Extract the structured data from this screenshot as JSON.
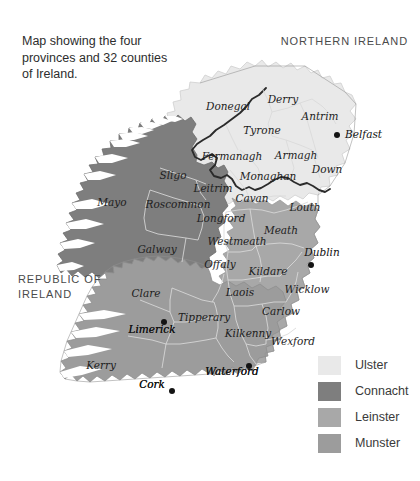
{
  "caption": "Map showing the four provinces and 32 counties of Ireland.",
  "titles": {
    "northern_ireland": "NORTHERN IRELAND",
    "republic_of_ireland_line1": "REPUBLIC OF",
    "republic_of_ireland_line2": "IRELAND"
  },
  "legend": {
    "items": [
      {
        "label": "Ulster",
        "color": "#e9e9e9"
      },
      {
        "label": "Connacht",
        "color": "#7e7e7e"
      },
      {
        "label": "Leinster",
        "color": "#a8a8a8"
      },
      {
        "label": "Munster",
        "color": "#9c9c9c"
      }
    ]
  },
  "provinces": {
    "ulster": {
      "name": "Ulster",
      "color": "#e9e9e9"
    },
    "connacht": {
      "name": "Connacht",
      "color": "#7e7e7e"
    },
    "leinster": {
      "name": "Leinster",
      "color": "#a8a8a8"
    },
    "munster": {
      "name": "Munster",
      "color": "#9c9c9c"
    }
  },
  "counties": [
    {
      "name": "Donegal",
      "province": "ulster",
      "x": 228,
      "y": 110
    },
    {
      "name": "Derry",
      "province": "ulster",
      "x": 283,
      "y": 103
    },
    {
      "name": "Tyrone",
      "province": "ulster",
      "x": 262,
      "y": 134
    },
    {
      "name": "Antrim",
      "province": "ulster",
      "x": 320,
      "y": 120
    },
    {
      "name": "Fermanagh",
      "province": "ulster",
      "x": 232,
      "y": 160
    },
    {
      "name": "Armagh",
      "province": "ulster",
      "x": 296,
      "y": 159
    },
    {
      "name": "Down",
      "province": "ulster",
      "x": 327,
      "y": 173
    },
    {
      "name": "Monaghan",
      "province": "ulster",
      "x": 268,
      "y": 180
    },
    {
      "name": "Cavan",
      "province": "ulster",
      "x": 252,
      "y": 202
    },
    {
      "name": "Sligo",
      "province": "connacht",
      "x": 173,
      "y": 179
    },
    {
      "name": "Mayo",
      "province": "connacht",
      "x": 112,
      "y": 206
    },
    {
      "name": "Leitrim",
      "province": "connacht",
      "x": 213,
      "y": 192
    },
    {
      "name": "Roscommon",
      "province": "connacht",
      "x": 178,
      "y": 208
    },
    {
      "name": "Galway",
      "province": "connacht",
      "x": 157,
      "y": 253
    },
    {
      "name": "Longford",
      "province": "leinster",
      "x": 221,
      "y": 222
    },
    {
      "name": "Westmeath",
      "province": "leinster",
      "x": 237,
      "y": 245
    },
    {
      "name": "Louth",
      "province": "leinster",
      "x": 305,
      "y": 211
    },
    {
      "name": "Meath",
      "province": "leinster",
      "x": 281,
      "y": 234
    },
    {
      "name": "Offaly",
      "province": "leinster",
      "x": 220,
      "y": 268
    },
    {
      "name": "Kildare",
      "province": "leinster",
      "x": 268,
      "y": 275
    },
    {
      "name": "Laois",
      "province": "leinster",
      "x": 240,
      "y": 296
    },
    {
      "name": "Wicklow",
      "province": "leinster",
      "x": 307,
      "y": 293
    },
    {
      "name": "Carlow",
      "province": "leinster",
      "x": 281,
      "y": 315
    },
    {
      "name": "Kilkenny",
      "province": "leinster",
      "x": 248,
      "y": 337
    },
    {
      "name": "Wexford",
      "province": "leinster",
      "x": 293,
      "y": 345
    },
    {
      "name": "Clare",
      "province": "munster",
      "x": 146,
      "y": 297
    },
    {
      "name": "Limerick",
      "province": "munster",
      "x": 152,
      "y": 333
    },
    {
      "name": "Tipperary",
      "province": "munster",
      "x": 204,
      "y": 321
    },
    {
      "name": "Kerry",
      "province": "munster",
      "x": 101,
      "y": 369
    },
    {
      "name": "Cork",
      "province": "munster",
      "x": 152,
      "y": 388
    },
    {
      "name": "Waterford",
      "province": "munster",
      "x": 232,
      "y": 375
    }
  ],
  "cities": [
    {
      "name": "Belfast",
      "x": 345,
      "y": 138,
      "dot_x": 337,
      "dot_y": 135,
      "anchor": "start"
    },
    {
      "name": "Dublin",
      "x": 322,
      "y": 256,
      "dot_x": 311,
      "dot_y": 265,
      "anchor": "middle"
    },
    {
      "name": "Limerick",
      "x": 152,
      "y": 333,
      "dot_x": 164,
      "dot_y": 322,
      "anchor": "middle"
    },
    {
      "name": "Cork",
      "x": 152,
      "y": 388,
      "dot_x": 172,
      "dot_y": 391,
      "anchor": "middle"
    },
    {
      "name": "Waterford",
      "x": 232,
      "y": 375,
      "dot_x": 249,
      "dot_y": 366,
      "anchor": "middle"
    }
  ]
}
